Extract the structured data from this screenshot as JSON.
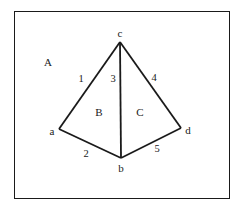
{
  "diagram": {
    "type": "planar-graph",
    "stroke_color": "#1a1a1a",
    "background": "#ffffff",
    "frame": {
      "x": 14,
      "y": 11,
      "width": 216,
      "height": 188
    },
    "vertices": [
      {
        "id": "a",
        "label": "a",
        "x": 59,
        "y": 129,
        "label_x": 52,
        "label_y": 131
      },
      {
        "id": "b",
        "label": "b",
        "x": 121,
        "y": 158,
        "label_x": 121,
        "label_y": 168
      },
      {
        "id": "c",
        "label": "c",
        "x": 120,
        "y": 42,
        "label_x": 120,
        "label_y": 33
      },
      {
        "id": "d",
        "label": "d",
        "x": 181,
        "y": 128,
        "label_x": 188,
        "label_y": 130
      }
    ],
    "edges": [
      {
        "id": "1",
        "label": "1",
        "from": "c",
        "to": "a",
        "label_x": 81,
        "label_y": 79
      },
      {
        "id": "2",
        "label": "2",
        "from": "a",
        "to": "b",
        "label_x": 86,
        "label_y": 154
      },
      {
        "id": "3",
        "label": "3",
        "from": "c",
        "to": "b",
        "label_x": 113,
        "label_y": 79
      },
      {
        "id": "4",
        "label": "4",
        "from": "c",
        "to": "d",
        "label_x": 154,
        "label_y": 78
      },
      {
        "id": "5",
        "label": "5",
        "from": "b",
        "to": "d",
        "label_x": 157,
        "label_y": 149
      }
    ],
    "regions": [
      {
        "id": "A",
        "label": "A",
        "x": 48,
        "y": 62
      },
      {
        "id": "B",
        "label": "B",
        "x": 99,
        "y": 112
      },
      {
        "id": "C",
        "label": "C",
        "x": 140,
        "y": 112
      }
    ]
  }
}
